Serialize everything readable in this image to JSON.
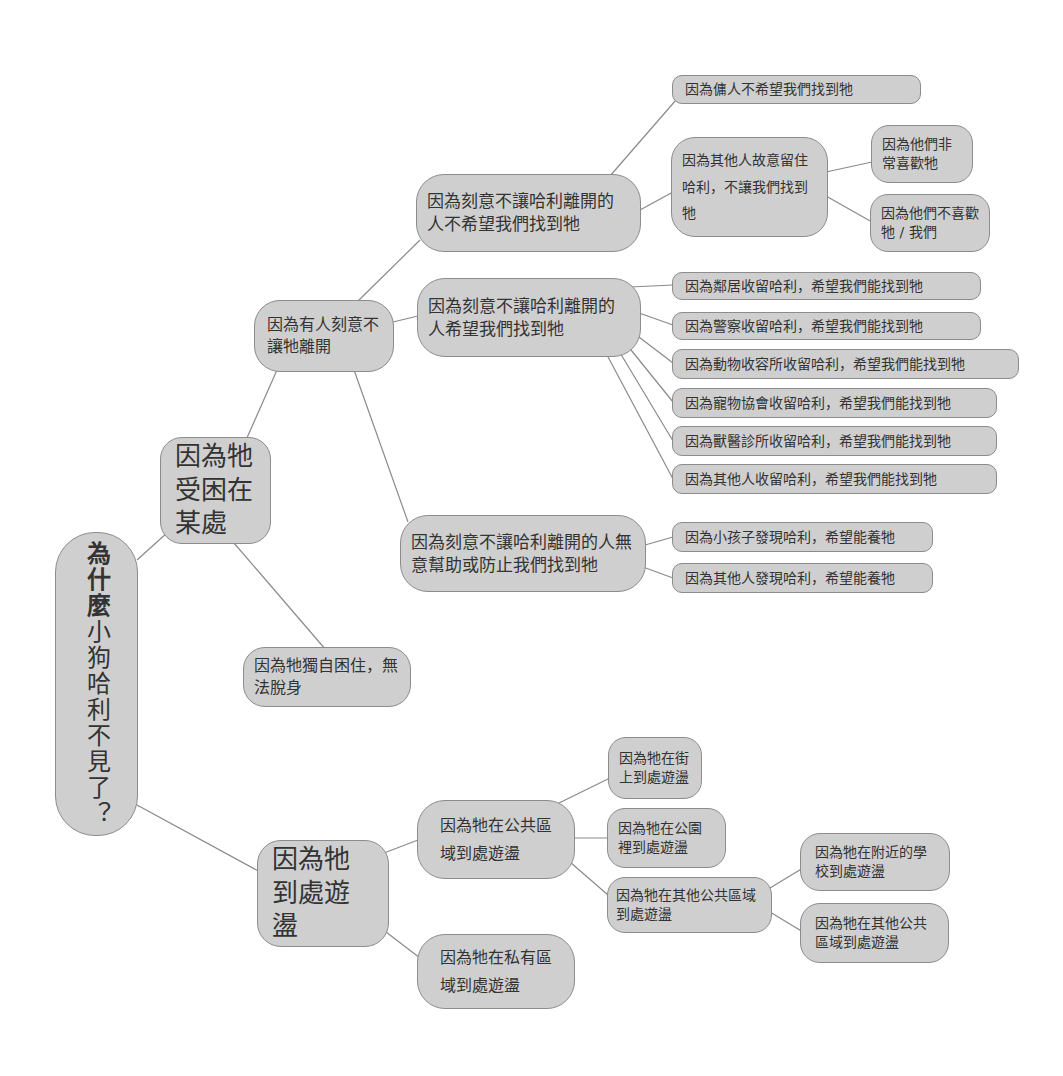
{
  "diagram": {
    "type": "mind-map",
    "root": {
      "label_bold": "為什麼",
      "label_rest": "小狗哈利不見了？"
    },
    "nodes": {
      "trapped": "因為牠受困在某處",
      "kept_by_someone": "因為有人刻意不讓牠離開",
      "kept_not_want_found": "因為刻意不讓哈利離開的人不希望我們找到牠",
      "servant": "因為傭人不希望我們找到牠",
      "others_keep": "因為其他人故意留住哈利，不讓我們找到牠",
      "they_like": "因為他們非常喜歡牠",
      "they_dislike": "因為他們不喜歡牠 / 我們",
      "kept_want_found": "因為刻意不讓哈利離開的人希望我們找到牠",
      "want_found_leaves": [
        "因為鄰居收留哈利，希望我們能找到牠",
        "因為警察收留哈利，希望我們能找到牠",
        "因為動物收容所收留哈利，希望我們能找到牠",
        "因為寵物協會收留哈利，希望我們能找到牠",
        "因為獸醫診所收留哈利，希望我們能找到牠",
        "因為其他人收留哈利，希望我們能找到牠"
      ],
      "kept_unintentional": "因為刻意不讓哈利離開的人無意幫助或防止我們找到牠",
      "unintentional_leaves": [
        "因為小孩子發現哈利，希望能養牠",
        "因為其他人發現哈利，希望能養牠"
      ],
      "trapped_alone": "因為牠獨自困住，無法脫身",
      "wandering": "因為牠到處遊盪",
      "public_area": "因為牠在公共區域到處遊盪",
      "private_area": "因為牠在私有區域到處遊盪",
      "street": "因為牠在街上到處遊盪",
      "park": "因為牠在公園裡到處遊盪",
      "other_public": "因為牠在其他公共區域到處遊盪",
      "school": "因為牠在附近的學校到處遊盪",
      "other_public_2": "因為牠在其他公共區域到處遊盪"
    }
  }
}
